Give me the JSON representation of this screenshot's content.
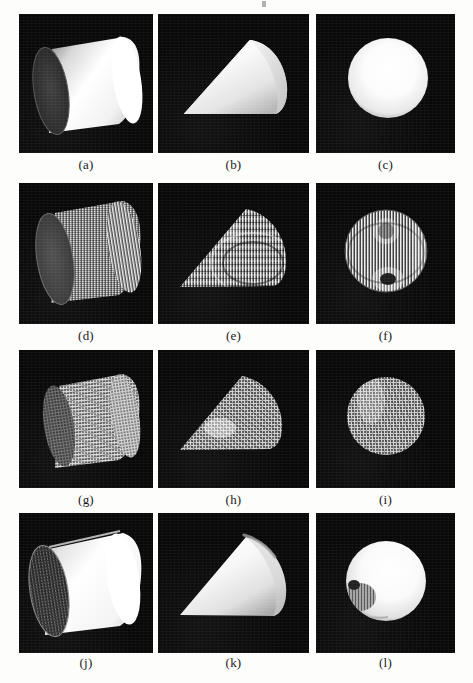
{
  "figure": {
    "background_color": "#fdfdfb",
    "panel_background": "#080808",
    "shape_highlight_color": "#ffffff",
    "columns": [
      "cylinder",
      "cone",
      "sphere"
    ],
    "grid": {
      "rows": 4,
      "cols": 3
    },
    "layout": {
      "panel_width": 134,
      "panel_height": 139,
      "col_x": [
        19,
        158,
        316
      ],
      "row_y": [
        14,
        183,
        350,
        513
      ],
      "caption_y": [
        158,
        327,
        491,
        656
      ]
    },
    "panels": [
      {
        "label": "(a)",
        "shape": "cylinder",
        "render": "smooth-shaded",
        "row": 1,
        "col": 1
      },
      {
        "label": "(b)",
        "shape": "cone",
        "render": "smooth-shaded",
        "row": 1,
        "col": 2
      },
      {
        "label": "(c)",
        "shape": "sphere",
        "render": "smooth-shaded",
        "row": 1,
        "col": 3
      },
      {
        "label": "(d)",
        "shape": "cylinder",
        "render": "striped-noisy",
        "row": 2,
        "col": 1
      },
      {
        "label": "(e)",
        "shape": "cone",
        "render": "striped-noisy",
        "row": 2,
        "col": 2
      },
      {
        "label": "(f)",
        "shape": "sphere",
        "render": "striped-noisy",
        "row": 2,
        "col": 3
      },
      {
        "label": "(g)",
        "shape": "cylinder",
        "render": "speckled-textured",
        "row": 3,
        "col": 1
      },
      {
        "label": "(h)",
        "shape": "cone",
        "render": "speckled-textured",
        "row": 3,
        "col": 2
      },
      {
        "label": "(i)",
        "shape": "sphere",
        "render": "speckled-textured",
        "row": 3,
        "col": 3
      },
      {
        "label": "(j)",
        "shape": "cylinder",
        "render": "recovered-smooth",
        "row": 4,
        "col": 1
      },
      {
        "label": "(k)",
        "shape": "cone",
        "render": "recovered-smooth",
        "row": 4,
        "col": 2
      },
      {
        "label": "(l)",
        "shape": "sphere",
        "render": "recovered-smooth",
        "row": 4,
        "col": 3
      }
    ]
  }
}
